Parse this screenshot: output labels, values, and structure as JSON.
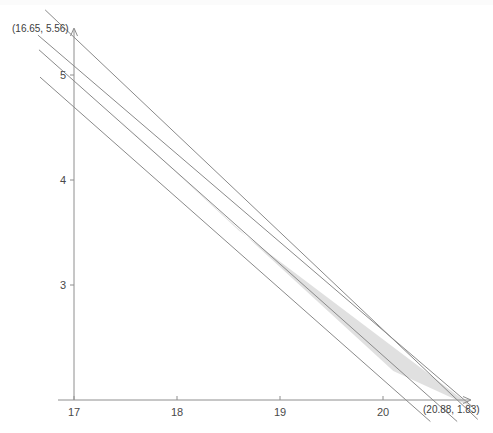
{
  "chart_data": {
    "type": "line",
    "title": "",
    "subtitle": "",
    "xlabel": "",
    "ylabel": "",
    "xlim": [
      16.65,
      20.95
    ],
    "ylim": [
      1.7,
      5.75
    ],
    "grid": false,
    "legend": "none",
    "background_color": "#ffffff",
    "line_color": "#8a8a8a",
    "region_fill_color": "#d3d3d3",
    "axis_color": "#8e8e8e",
    "xticks": [
      {
        "value": 17,
        "label": "17"
      },
      {
        "value": 18,
        "label": "18"
      },
      {
        "value": 19,
        "label": "19"
      },
      {
        "value": 20,
        "label": "20"
      }
    ],
    "yticks": [
      {
        "value": 3,
        "label": "3"
      },
      {
        "value": 4,
        "label": "4"
      },
      {
        "value": 5,
        "label": "5"
      }
    ],
    "series": [
      {
        "name": "line-1",
        "x": [
          16.72,
          20.92
        ],
        "y": [
          5.62,
          1.72
        ]
      },
      {
        "name": "line-2",
        "x": [
          16.65,
          20.88
        ],
        "y": [
          5.38,
          1.83
        ]
      },
      {
        "name": "line-3",
        "x": [
          16.66,
          20.72
        ],
        "y": [
          5.24,
          1.7
        ]
      },
      {
        "name": "line-4",
        "x": [
          16.67,
          20.46
        ],
        "y": [
          4.98,
          1.7
        ]
      }
    ],
    "region": {
      "name": "feasible-region",
      "fill": "#d4d4d4",
      "opacity": 0.72,
      "vertices_x": [
        17.28,
        18.6,
        20.88,
        20.1
      ],
      "vertices_y": [
        4.72,
        3.52,
        1.83,
        2.18
      ]
    },
    "annotations": [
      {
        "name": "upper-left-point-label",
        "text": "(16.65, 5.56)",
        "x": 16.68,
        "y": 5.62,
        "px": 12,
        "py": 32
      },
      {
        "name": "lower-right-point-label",
        "text": "(20.88, 1.83)",
        "x": 20.88,
        "y": 1.83,
        "px": 423,
        "py": 413
      }
    ]
  }
}
